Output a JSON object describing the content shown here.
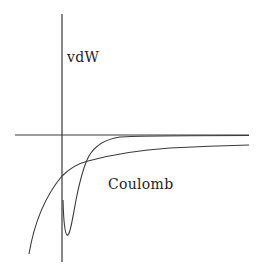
{
  "diagram": {
    "type": "potential-energy-curves",
    "labels": {
      "vdw": "vdW",
      "coulomb": "Coulomb"
    },
    "colors": {
      "line": "#3a3a3a",
      "text": "#1e1e1e",
      "background": "#ffffff"
    },
    "axes": {
      "vertical": {
        "x": 62,
        "y_top": 14,
        "y_bottom": 262
      },
      "horizontal": {
        "y": 135,
        "x_left": 15,
        "x_right": 249
      }
    },
    "curves": [
      {
        "name": "vdW",
        "description": "Sharp potential well with minimum just right of vertical axis, approaching zero from below"
      },
      {
        "name": "Coulomb",
        "description": "Long-range attractive curve diverging negative at small r, approaching zero slowly"
      }
    ]
  }
}
